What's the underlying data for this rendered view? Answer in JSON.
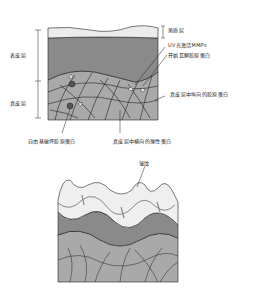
{
  "figure_top": {
    "labels": {
      "stratum_corneum": "角质层",
      "epidermis": "表皮层",
      "dermis": "真皮层",
      "uv_mmps": "UV光激活MMPs",
      "collagen_breakdown": "开始瓦解胶原蛋白",
      "vertical_collagen": "真皮层中纵向的胶原蛋白",
      "free_radicals": "自由基破坏胶原蛋白",
      "horizontal_elastin": "真皮层中横向的弹性蛋白"
    }
  },
  "figure_bottom": {
    "labels": {
      "wrinkle": "皱纹"
    }
  },
  "colors": {
    "stratum_corneum": "#ececec",
    "epidermis": "#8a8a8a",
    "dermis": "#a9a9a9",
    "lines": "#222222",
    "wrinkled_surface": "#efefef"
  }
}
